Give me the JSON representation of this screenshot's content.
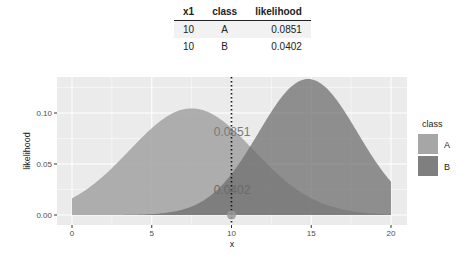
{
  "table": {
    "headers": [
      "x1",
      "class",
      "likelihood"
    ],
    "rows": [
      {
        "x1": "10",
        "class": "A",
        "likelihood": "0.0851"
      },
      {
        "x1": "10",
        "class": "B",
        "likelihood": "0.0402"
      }
    ]
  },
  "chart_data": {
    "type": "area",
    "title": "",
    "xlabel": "x",
    "ylabel": "likelihood",
    "xlim": [
      0,
      20
    ],
    "ylim": [
      0,
      0.13
    ],
    "x_ticks": [
      "0",
      "5",
      "10",
      "15",
      "20"
    ],
    "y_ticks": [
      "0.00",
      "0.05",
      "0.10"
    ],
    "grid": true,
    "legend": {
      "title": "class",
      "entries": [
        "A",
        "B"
      ],
      "position": "right"
    },
    "series": [
      {
        "name": "A",
        "distribution": "normal",
        "mean": 7.5,
        "sd": 3.9,
        "peak": 0.103,
        "value_at_x10": 0.0851,
        "color": "#a6a6a6"
      },
      {
        "name": "B",
        "distribution": "normal",
        "mean": 14.8,
        "sd": 3.1,
        "peak": 0.128,
        "value_at_x10": 0.0402,
        "color": "#7f7f7f"
      }
    ],
    "annotations": [
      {
        "type": "vline",
        "x": 10,
        "style": "dotted"
      },
      {
        "type": "point",
        "x": 10,
        "y": 0
      },
      {
        "type": "label",
        "x": 10,
        "y": 0.0851,
        "text": "0.0851"
      },
      {
        "type": "label",
        "x": 10,
        "y": 0.0402,
        "text": "0.0402"
      }
    ]
  }
}
